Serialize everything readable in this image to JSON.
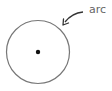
{
  "diagram": {
    "circle": {
      "cx": 38,
      "cy": 52,
      "r": 31.5,
      "stroke": "#777777",
      "stroke_width": 1.2
    },
    "center_point": {
      "cx": 38,
      "cy": 52,
      "r": 2.2,
      "fill": "#111111"
    },
    "arrow": {
      "stroke": "#333333"
    },
    "label": {
      "text": "arc",
      "color": "#666666"
    }
  }
}
